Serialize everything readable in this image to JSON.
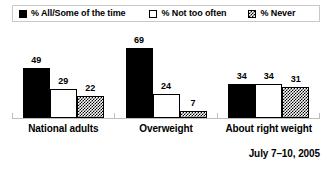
{
  "legend": {
    "entries": [
      {
        "label": "% All/Some of the time",
        "swatch": "solid-black-square",
        "color": "#000000"
      },
      {
        "label": "% Not too often",
        "swatch": "open-white-square",
        "color": "#ffffff"
      },
      {
        "label": "% Never",
        "swatch": "hatched-square",
        "color": "#000000"
      }
    ]
  },
  "footnote": {
    "date_range": "July 7–10, 2005"
  },
  "chart_data": {
    "type": "bar",
    "title": "",
    "subtitle": "",
    "xlabel": "",
    "ylabel": "",
    "ylim": [
      0,
      75
    ],
    "grid": false,
    "legend_position": "top",
    "categories": [
      "National adults",
      "Overweight",
      "About right weight"
    ],
    "series": [
      {
        "name": "% All/Some of the time",
        "fill": "solid-black",
        "values": [
          49,
          69,
          34
        ]
      },
      {
        "name": "% Not too often",
        "fill": "white-outline",
        "values": [
          29,
          24,
          34
        ]
      },
      {
        "name": "% Never",
        "fill": "diagonal-crosshatch",
        "values": [
          22,
          7,
          31
        ]
      }
    ],
    "annotations": [
      "July 7–10, 2005"
    ]
  }
}
